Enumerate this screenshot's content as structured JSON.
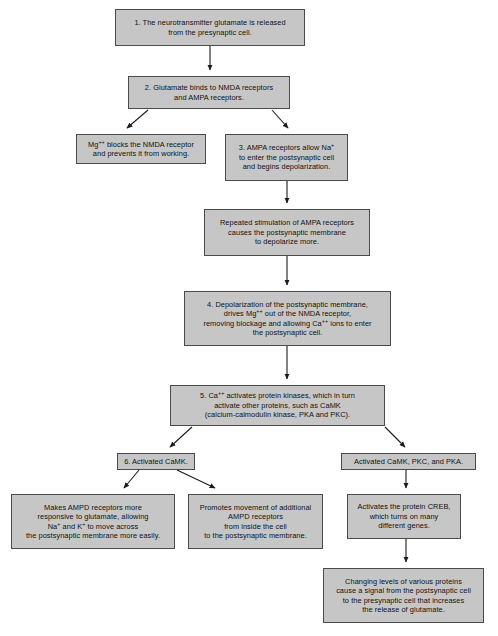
{
  "diagram": {
    "box_fill_color": "#c6c6c6",
    "box_border_color": "#4a4a4a",
    "arrow_color": "#1b1b1b",
    "background_color": "#ffffff"
  },
  "nodes": {
    "n1": {
      "lines": [
        "1. The neurotransmitter glutamate is released",
        "from the presynaptic cell."
      ],
      "x": 115,
      "y": 9,
      "w": 190,
      "h": 37
    },
    "n2": {
      "lines": [
        "2. Glutamate binds to NMDA receptors",
        "and AMPA receptors."
      ],
      "x": 128,
      "y": 76,
      "w": 162,
      "h": 33
    },
    "n3": {
      "lines": [
        "Mg<sup>++</sup> blocks the NMDA receptor",
        "and prevents it from working."
      ],
      "x": 76,
      "y": 134,
      "w": 130,
      "h": 30
    },
    "n4": {
      "lines": [
        "3. AMPA receptors allow Na<sup>+</sup>",
        "to enter the postsynaptic cell",
        "and begins depolarization."
      ],
      "x": 225,
      "y": 134,
      "w": 123,
      "h": 47
    },
    "n5": {
      "lines": [
        "Repeated stimulation of AMPA receptors",
        "causes the postsynaptic membrane",
        "to depolarize more."
      ],
      "x": 204,
      "y": 209,
      "w": 166,
      "h": 47
    },
    "n6": {
      "lines": [
        "4. Depolarization of the postsynaptic membrane,",
        "drives Mg<sup>++</sup> out of the NMDA receptor,",
        "removing blockage and allowing Ca<sup>++</sup> ions to enter",
        "the postsynaptic cell."
      ],
      "x": 184,
      "y": 291,
      "w": 207,
      "h": 55
    },
    "n7": {
      "lines": [
        "5. Ca<sup>++</sup> activates protein kinases, which in turn",
        "activate other proteins, such as CaMK",
        "(calcium-calmodulin kinase, PKA and PKC)."
      ],
      "x": 170,
      "y": 385,
      "w": 215,
      "h": 41
    },
    "n8": {
      "lines": [
        "6. Activated CaMK."
      ],
      "x": 117,
      "y": 453,
      "w": 78,
      "h": 17
    },
    "n9": {
      "lines": [
        "Activated CaMK, PKC, and PKA."
      ],
      "x": 341,
      "y": 453,
      "w": 135,
      "h": 17
    },
    "n10": {
      "lines": [
        "Makes AMPD receptors more",
        "responsive to glutamate, allowing",
        "Na<sup>+</sup> and K<sup>+</sup> to move across",
        "the postsynaptic membrane more easily."
      ],
      "x": 11,
      "y": 494,
      "w": 164,
      "h": 55
    },
    "n11": {
      "lines": [
        "Promotes movement of additional",
        "AMPD receptors",
        "from inside the cell",
        "to the postsynaptic membrane."
      ],
      "x": 188,
      "y": 494,
      "w": 135,
      "h": 55
    },
    "n12": {
      "lines": [
        "Activates the protein CREB,",
        "which turns on many",
        "different genes."
      ],
      "x": 347,
      "y": 494,
      "w": 114,
      "h": 45
    },
    "n13": {
      "lines": [
        "Changing levels of various proteins",
        "cause a signal from the postsynaptic cell",
        "to the presynaptic cell that increases",
        "the release of glutamate."
      ],
      "x": 323,
      "y": 568,
      "w": 161,
      "h": 55
    }
  },
  "edges": [
    {
      "name": "edge-n1-to-n2",
      "from": "n1",
      "to": "n2"
    },
    {
      "name": "edge-n2-to-n3",
      "from": "n2",
      "to": "n3"
    },
    {
      "name": "edge-n2-to-n4",
      "from": "n2",
      "to": "n4"
    },
    {
      "name": "edge-n4-to-n5",
      "from": "n4",
      "to": "n5"
    },
    {
      "name": "edge-n5-to-n6",
      "from": "n5",
      "to": "n6"
    },
    {
      "name": "edge-n6-to-n7",
      "from": "n6",
      "to": "n7"
    },
    {
      "name": "edge-n7-to-n8",
      "from": "n7",
      "to": "n8"
    },
    {
      "name": "edge-n7-to-n9",
      "from": "n7",
      "to": "n9"
    },
    {
      "name": "edge-n8-to-n10",
      "from": "n8",
      "to": "n10"
    },
    {
      "name": "edge-n8-to-n11",
      "from": "n8",
      "to": "n11"
    },
    {
      "name": "edge-n9-to-n12",
      "from": "n9",
      "to": "n12"
    },
    {
      "name": "edge-n12-to-n13",
      "from": "n12",
      "to": "n13"
    }
  ]
}
